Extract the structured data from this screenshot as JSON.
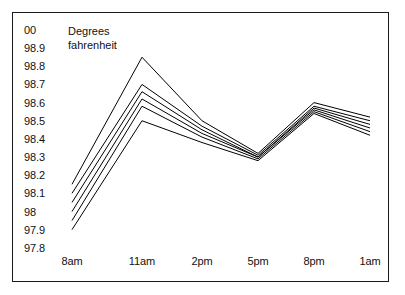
{
  "figure": {
    "caption": "Degrees\nfahrenheit",
    "frame_color": "#1a1a1a",
    "line_color": "#000000",
    "background": "#ffffff"
  },
  "chart_data": {
    "type": "line",
    "title": "",
    "subtitle": "",
    "xlabel": "",
    "ylabel": "Degrees fahrenheit",
    "annotations": [
      "Degrees fahrenheit"
    ],
    "grid": false,
    "legend": "none",
    "categories": [
      "8am",
      "11am",
      "2pm",
      "5pm",
      "8pm",
      "1am"
    ],
    "x": [
      "8am",
      "11am",
      "2pm",
      "5pm",
      "8pm",
      "1am"
    ],
    "ytick_labels": [
      "00",
      "98.9",
      "98.8",
      "98.7",
      "98.6",
      "98.5",
      "98.4",
      "98.3",
      "98.2",
      "98.1",
      "98",
      "97.9",
      "97.8"
    ],
    "ytick_values": [
      99.0,
      98.9,
      98.8,
      98.7,
      98.6,
      98.5,
      98.4,
      98.3,
      98.2,
      98.1,
      98.0,
      97.9,
      97.8
    ],
    "ylim": [
      97.8,
      99.0
    ],
    "series": [
      {
        "name": "subject-1",
        "values": [
          98.15,
          98.85,
          98.5,
          98.32,
          98.6,
          98.52
        ]
      },
      {
        "name": "subject-2",
        "values": [
          98.1,
          98.7,
          98.47,
          98.31,
          98.58,
          98.5
        ]
      },
      {
        "name": "subject-3",
        "values": [
          98.05,
          98.66,
          98.45,
          98.3,
          98.57,
          98.48
        ]
      },
      {
        "name": "subject-4",
        "values": [
          98.0,
          98.62,
          98.43,
          98.3,
          98.56,
          98.46
        ]
      },
      {
        "name": "subject-5",
        "values": [
          97.95,
          98.58,
          98.41,
          98.29,
          98.55,
          98.44
        ]
      },
      {
        "name": "subject-6",
        "values": [
          97.9,
          98.5,
          98.38,
          98.28,
          98.54,
          98.42
        ]
      }
    ]
  }
}
